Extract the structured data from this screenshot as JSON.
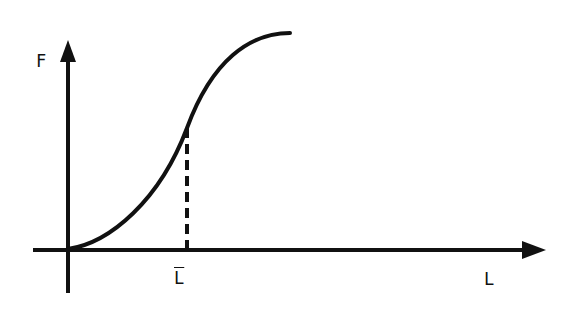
{
  "diagram": {
    "type": "function-plot",
    "axes": {
      "y_label": "F",
      "x_label": "L",
      "x_marker_label": "L̄"
    },
    "curve": {
      "shape": "sigmoid",
      "start": "origin",
      "inflection_at": "L̄"
    },
    "colors": {
      "ink": "#111111",
      "background": "#ffffff"
    }
  }
}
